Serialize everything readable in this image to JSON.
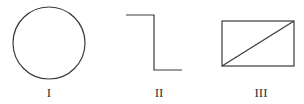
{
  "figures": [
    {
      "id": "I",
      "label": "I",
      "shape": "circle",
      "cx": 49,
      "cy": 43,
      "r": 36
    },
    {
      "id": "II",
      "label": "II",
      "shape": "step-line",
      "points": [
        [
          126,
          15
        ],
        [
          154,
          15
        ],
        [
          154,
          70
        ],
        [
          182,
          70
        ]
      ]
    },
    {
      "id": "III",
      "label": "III",
      "shape": "rectangle-with-diagonal",
      "x": 222,
      "y": 21,
      "width": 72,
      "height": 45,
      "diagonal": [
        [
          222,
          66
        ],
        [
          294,
          21
        ]
      ]
    }
  ],
  "labels": {
    "fig1": "I",
    "fig2": "II",
    "fig3": "III"
  },
  "style": {
    "stroke": "#3a3a3a",
    "background": "#ffffff"
  }
}
